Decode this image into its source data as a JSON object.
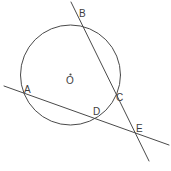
{
  "figure": {
    "background_color": "#ffffff",
    "stroke_color": "#4a4a4a",
    "label_color": "#3d3d3d",
    "width": 171,
    "height": 171
  },
  "circle": {
    "name": "circle-O",
    "center_label": "O",
    "cx": 70.5,
    "cy": 75,
    "r": 50
  },
  "center_mark": {
    "name": "center-dot",
    "cx": 70.5,
    "cy": 74.5,
    "r": 1.1
  },
  "labels": [
    {
      "id": "A",
      "text": "A",
      "x": 24,
      "y": 85
    },
    {
      "id": "B",
      "text": "B",
      "x": 79,
      "y": 9
    },
    {
      "id": "C",
      "text": "C",
      "x": 116,
      "y": 93
    },
    {
      "id": "D",
      "text": "D",
      "x": 93,
      "y": 107
    },
    {
      "id": "E",
      "text": "E",
      "x": 136,
      "y": 124
    },
    {
      "id": "O",
      "text": "O",
      "x": 66,
      "y": 76
    }
  ],
  "lines": [
    {
      "id": "line-BCE",
      "name": "secant-line-b-c-e",
      "through_points": [
        "B",
        "C",
        "E"
      ],
      "x1": 71,
      "y1": 2,
      "x2": 149,
      "y2": 161
    },
    {
      "id": "line-ADE",
      "name": "secant-line-a-d-e",
      "through_points": [
        "A",
        "D",
        "E"
      ],
      "x1": 4,
      "y1": 86,
      "x2": 169,
      "y2": 145
    }
  ],
  "intersections": [
    {
      "id": "A",
      "x": 30,
      "y": 95,
      "type": "circle-secant"
    },
    {
      "id": "B",
      "x": 77,
      "y": 22,
      "type": "circle-secant"
    },
    {
      "id": "C",
      "x": 113,
      "y": 97,
      "type": "circle-secant"
    },
    {
      "id": "D",
      "x": 98,
      "y": 120,
      "type": "circle-secant"
    },
    {
      "id": "E",
      "x": 133,
      "y": 132,
      "type": "line-line"
    }
  ]
}
